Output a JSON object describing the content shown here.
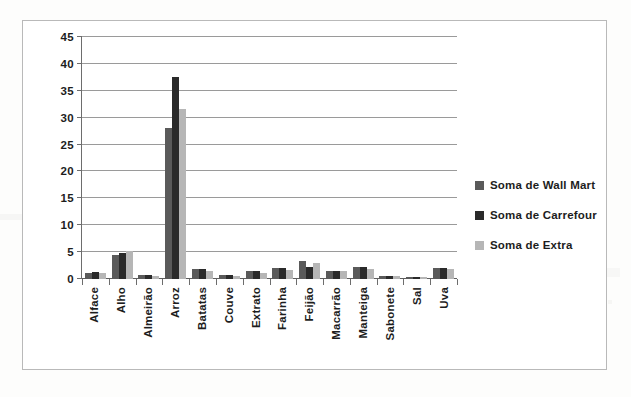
{
  "chart_data": {
    "type": "bar",
    "title": "",
    "subtitle": "",
    "xlabel": "",
    "ylabel": "",
    "ylim": [
      0,
      45
    ],
    "yticks": [
      0,
      5,
      10,
      15,
      20,
      25,
      30,
      35,
      40,
      45
    ],
    "grid": true,
    "legend_position": "right",
    "categories": [
      "Alface",
      "Alho",
      "Almeirão",
      "Arroz",
      "Batatas",
      "Couve",
      "Extrato",
      "Farinha",
      "Feijão",
      "Macarrão",
      "Manteiga",
      "Sabonete",
      "Sal",
      "Uva"
    ],
    "series": [
      {
        "name": "Soma de Wall Mart",
        "color": "#5a5a5a",
        "values": [
          1.1,
          4.5,
          0.8,
          28.0,
          1.8,
          0.7,
          1.4,
          2.0,
          3.4,
          1.4,
          2.2,
          0.5,
          0.4,
          2.0
        ]
      },
      {
        "name": "Soma de Carrefour",
        "color": "#2a2a2a",
        "values": [
          1.3,
          4.8,
          0.8,
          37.6,
          1.8,
          0.7,
          1.5,
          2.0,
          2.2,
          1.4,
          2.2,
          0.5,
          0.4,
          2.0
        ]
      },
      {
        "name": "Soma de Extra",
        "color": "#b6b6b6",
        "values": [
          1.1,
          5.2,
          0.6,
          31.7,
          1.4,
          0.5,
          1.2,
          1.6,
          2.9,
          1.5,
          1.8,
          0.6,
          0.4,
          1.9
        ]
      }
    ]
  },
  "legend": {
    "items": [
      {
        "label": "Soma de Wall Mart",
        "swatch": "legend-swatch-wall-mart"
      },
      {
        "label": "Soma de Carrefour",
        "swatch": "legend-swatch-carrefour"
      },
      {
        "label": "Soma de Extra",
        "swatch": "legend-swatch-extra"
      }
    ]
  }
}
